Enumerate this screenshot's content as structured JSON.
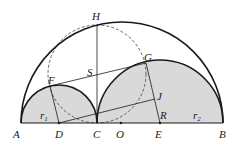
{
  "diagram": {
    "points": {
      "A": "A",
      "B": "B",
      "C": "C",
      "D": "D",
      "E": "E",
      "O": "O",
      "F": "F",
      "G": "G",
      "H": "H",
      "J": "J",
      "R": "R",
      "S": "S"
    },
    "radii": {
      "r1": {
        "base": "r",
        "sub": "1"
      },
      "r2": {
        "base": "r",
        "sub": "2"
      }
    },
    "colors": {
      "stroke": "#1a1a1a",
      "fill_gray": "#d9d9d9",
      "dashed": "#555555"
    }
  }
}
